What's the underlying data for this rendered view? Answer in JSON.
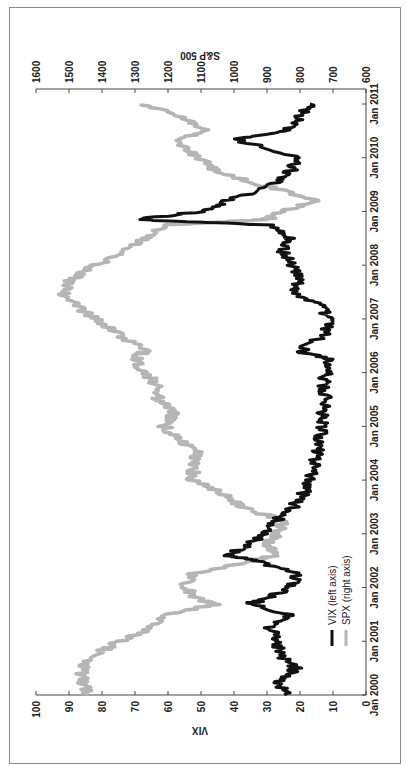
{
  "chart_data": {
    "type": "line",
    "orientation": "rotated 90deg counter-clockwise (time runs bottom-to-top)",
    "title": "",
    "xlabel": "",
    "ylabel_left": "VIX",
    "ylabel_right": "S&P 500",
    "x_ticks": [
      "Jan 2000",
      "Jan 2001",
      "Jan 2002",
      "Jan 2003",
      "Jan 2004",
      "Jan 2005",
      "Jan 2006",
      "Jan 2007",
      "Jan 2008",
      "Jan 2009",
      "Jan 2010",
      "Jan 2011"
    ],
    "ylim_left": [
      0,
      100
    ],
    "yticks_left": [
      0,
      10,
      20,
      30,
      40,
      50,
      60,
      70,
      80,
      90,
      100
    ],
    "ylim_right": [
      600,
      1600
    ],
    "yticks_right": [
      600,
      700,
      800,
      900,
      1000,
      1100,
      1200,
      1300,
      1400,
      1500,
      1600
    ],
    "grid": false,
    "legend_position": "lower-right (in rotated view)",
    "x": [
      2000.0,
      2000.25,
      2000.5,
      2000.75,
      2001.0,
      2001.25,
      2001.5,
      2001.7,
      2001.75,
      2002.0,
      2002.25,
      2002.5,
      2002.6,
      2002.8,
      2003.0,
      2003.25,
      2003.5,
      2003.75,
      2004.0,
      2004.25,
      2004.5,
      2004.75,
      2005.0,
      2005.25,
      2005.5,
      2005.75,
      2006.0,
      2006.25,
      2006.4,
      2006.75,
      2007.0,
      2007.25,
      2007.5,
      2007.75,
      2008.0,
      2008.25,
      2008.5,
      2008.75,
      2008.85,
      2009.0,
      2009.2,
      2009.5,
      2009.75,
      2010.0,
      2010.35,
      2010.5,
      2010.75,
      2011.0
    ],
    "series": [
      {
        "name": "VIX (left axis)",
        "color": "#111111",
        "values": [
          24,
          27,
          21,
          26,
          27,
          29,
          23,
          36,
          32,
          23,
          21,
          34,
          42,
          36,
          30,
          27,
          22,
          19,
          17,
          16,
          15,
          14,
          13,
          13,
          12,
          13,
          12,
          12,
          20,
          12,
          11,
          14,
          22,
          20,
          23,
          25,
          23,
          30,
          70,
          50,
          42,
          28,
          23,
          20,
          40,
          25,
          20,
          17
        ]
      },
      {
        "name": "SPX (right axis)",
        "color": "#b5b5b5",
        "values": [
          1440,
          1460,
          1460,
          1420,
          1350,
          1250,
          1200,
          1050,
          1100,
          1150,
          1130,
          950,
          880,
          900,
          870,
          850,
          980,
          1030,
          1130,
          1120,
          1110,
          1170,
          1210,
          1180,
          1230,
          1230,
          1270,
          1300,
          1270,
          1360,
          1420,
          1480,
          1520,
          1490,
          1420,
          1330,
          1270,
          1200,
          900,
          850,
          750,
          920,
          1050,
          1110,
          1180,
          1080,
          1150,
          1280
        ]
      }
    ]
  },
  "axes": {
    "left_title": "VIX",
    "right_title": "S&P 500",
    "vix_ticks": [
      "0",
      "10",
      "20",
      "30",
      "40",
      "50",
      "60",
      "70",
      "80",
      "90",
      "100"
    ],
    "spx_ticks": [
      "600",
      "700",
      "800",
      "900",
      "1000",
      "1100",
      "1200",
      "1300",
      "1400",
      "1500",
      "1600"
    ],
    "time_ticks": [
      "Jan 2000",
      "Jan 2001",
      "Jan 2002",
      "Jan 2003",
      "Jan 2004",
      "Jan 2005",
      "Jan 2006",
      "Jan 2007",
      "Jan 2008",
      "Jan 2009",
      "Jan 2010",
      "Jan 2011"
    ]
  },
  "legend": {
    "vix_label": "VIX (left axis)",
    "spx_label": "SPX (right axis)",
    "vix_color": "#111111",
    "spx_color": "#b5b5b5"
  }
}
